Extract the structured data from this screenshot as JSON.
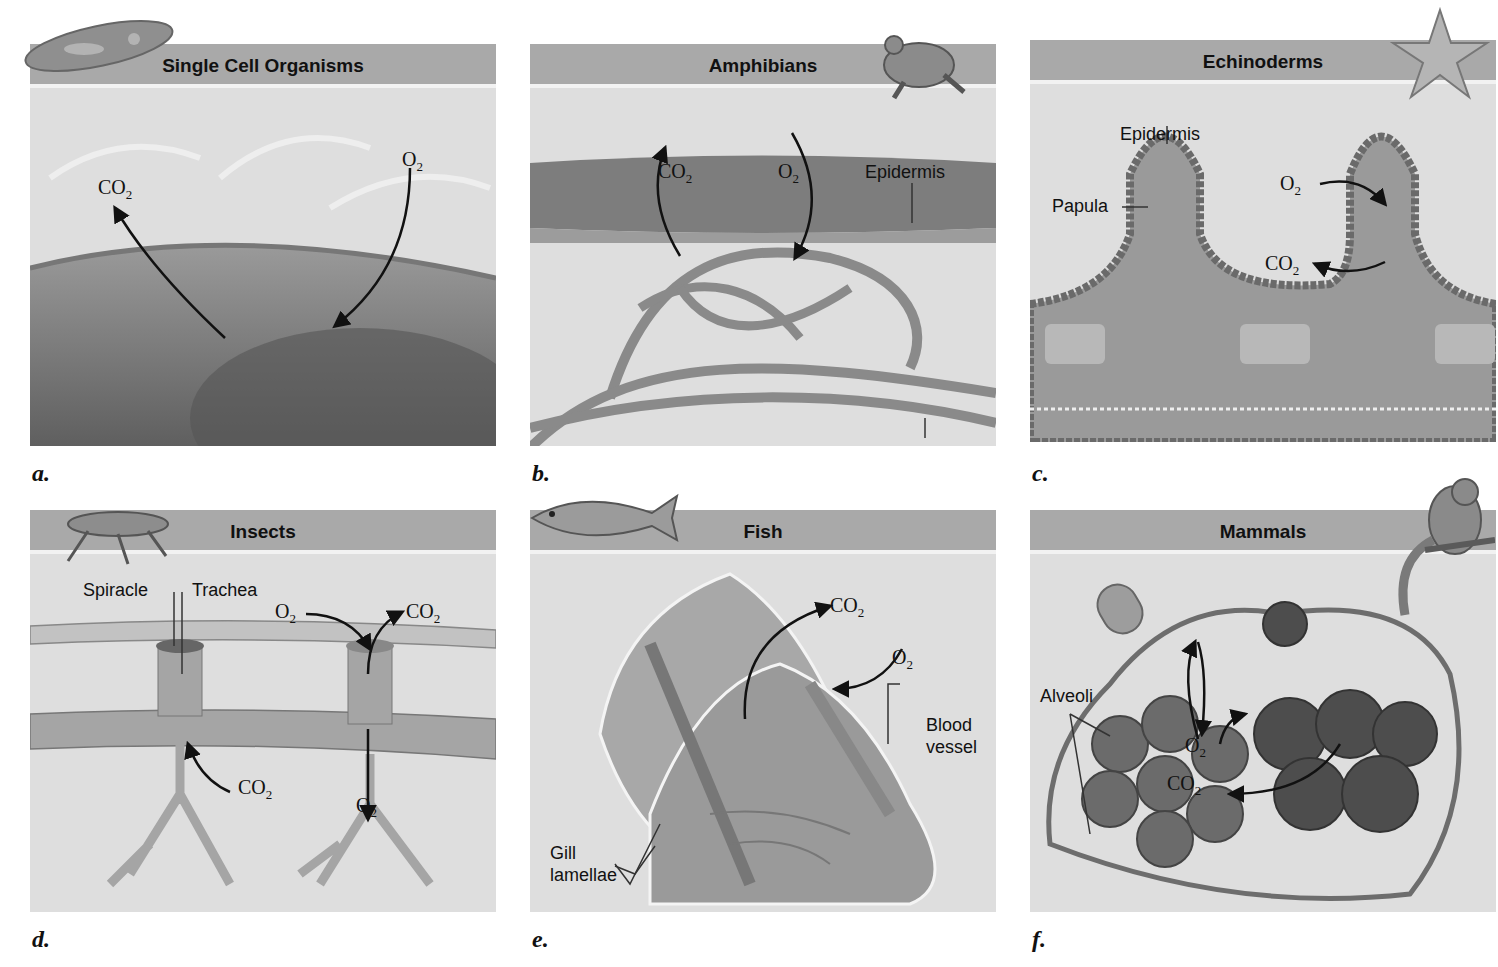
{
  "figure": {
    "panels": [
      {
        "id": "a",
        "letter": "a.",
        "title": "Single Cell Organisms",
        "animal_icon": "paramecium-icon",
        "labels": [],
        "gases": [
          {
            "text": "CO",
            "sub": "2",
            "direction": "out"
          },
          {
            "text": "O",
            "sub": "2",
            "direction": "in"
          }
        ]
      },
      {
        "id": "b",
        "letter": "b.",
        "title": "Amphibians",
        "animal_icon": "frog-icon",
        "labels": [
          "Epidermis",
          "Blood vessel"
        ],
        "gases": [
          {
            "text": "CO",
            "sub": "2",
            "direction": "out"
          },
          {
            "text": "O",
            "sub": "2",
            "direction": "in"
          }
        ]
      },
      {
        "id": "c",
        "letter": "c.",
        "title": "Echinoderms",
        "animal_icon": "starfish-icon",
        "labels": [
          "Epidermis",
          "Papula"
        ],
        "gases": [
          {
            "text": "O",
            "sub": "2",
            "direction": "in"
          },
          {
            "text": "CO",
            "sub": "2",
            "direction": "out"
          }
        ]
      },
      {
        "id": "d",
        "letter": "d.",
        "title": "Insects",
        "animal_icon": "grasshopper-icon",
        "labels": [
          "Spiracle",
          "Trachea"
        ],
        "gases": [
          {
            "text": "O",
            "sub": "2",
            "direction": "in"
          },
          {
            "text": "CO",
            "sub": "2",
            "direction": "out"
          },
          {
            "text": "CO",
            "sub": "2",
            "direction": "up"
          },
          {
            "text": "O",
            "sub": "2",
            "direction": "down"
          }
        ]
      },
      {
        "id": "e",
        "letter": "e.",
        "title": "Fish",
        "animal_icon": "fish-icon",
        "labels": [
          "Blood vessel",
          "Gill lamellae"
        ],
        "label_lines": {
          "blood_1": "Blood",
          "blood_2": "vessel",
          "gill_1": "Gill",
          "gill_2": "lamellae"
        },
        "gases": [
          {
            "text": "CO",
            "sub": "2",
            "direction": "out"
          },
          {
            "text": "O",
            "sub": "2",
            "direction": "in"
          }
        ]
      },
      {
        "id": "f",
        "letter": "f.",
        "title": "Mammals",
        "animal_icon": "chipmunk-icon",
        "labels": [
          "Alveoli"
        ],
        "gases": [
          {
            "text": "O",
            "sub": "2",
            "direction": "in"
          },
          {
            "text": "CO",
            "sub": "2",
            "direction": "out"
          }
        ]
      }
    ],
    "colors": {
      "header": "#a9a9a9",
      "panel_bg": "#dedede",
      "tissue": "#8a8a8a",
      "arrow": "#111111"
    }
  }
}
